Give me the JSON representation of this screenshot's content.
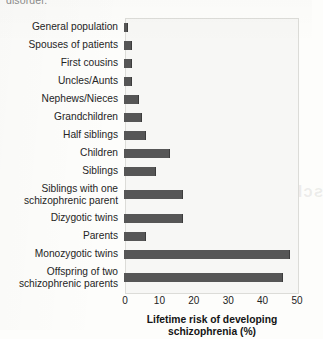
{
  "page": {
    "cropped_text_top": "disorder.",
    "bleed_through_line1": "schizophrenia",
    "bleed_through_line2": "Figure 16.3"
  },
  "chart_data": {
    "type": "bar",
    "orientation": "horizontal",
    "title": "",
    "xlabel": "Lifetime risk of developing schizophrenia (%)",
    "xlabel_line1": "Lifetime risk of developing",
    "xlabel_line2": "schizophrenia (%)",
    "ylabel": "",
    "xlim": [
      0,
      50
    ],
    "xticks": [
      0,
      10,
      20,
      30,
      40,
      50
    ],
    "xtick_labels": [
      "0",
      "10",
      "20",
      "30",
      "40",
      "50"
    ],
    "grid": false,
    "legend": "none",
    "bar_color": "#565656",
    "plot_background": "#f7f7f5",
    "categories": [
      "General population",
      "Spouses of patients",
      "First cousins",
      "Uncles/Aunts",
      "Nephews/Nieces",
      "Grandchildren",
      "Half siblings",
      "Children",
      "Siblings",
      "Siblings with one\nschizophrenic parent",
      "Dizygotic twins",
      "Parents",
      "Monozygotic twins",
      "Offspring of two\nschizophrenic parents"
    ],
    "values": [
      1,
      2,
      2,
      2,
      4,
      5,
      6,
      13,
      9,
      17,
      17,
      6,
      48,
      46
    ]
  }
}
